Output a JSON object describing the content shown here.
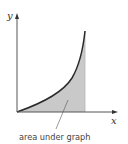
{
  "diagram": {
    "type": "area-under-curve",
    "axes": {
      "x_label": "x",
      "y_label": "y"
    },
    "curve": {
      "shape": "increasing convex (exponential-like)",
      "stroke_color": "#2a2a2a"
    },
    "shaded_region": {
      "fill_color": "#c9c9c9",
      "bounded_by": "curve, x-axis, vertical line at right end"
    },
    "annotation": {
      "label": "area under graph"
    },
    "colors": {
      "axis": "#555555",
      "background": "#ffffff"
    }
  }
}
